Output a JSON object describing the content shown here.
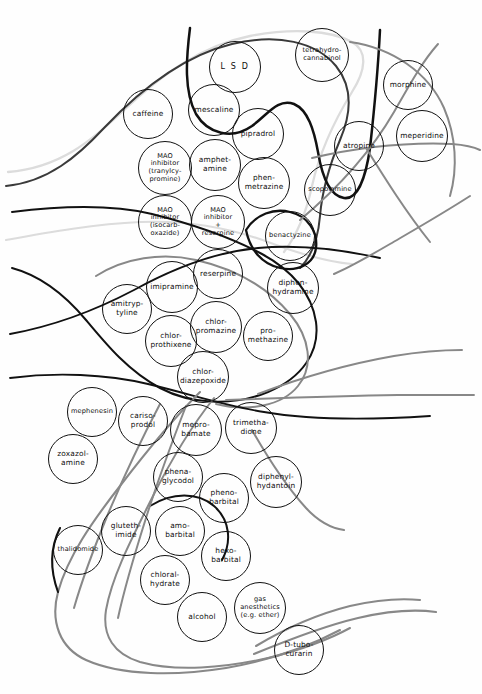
{
  "figure": {
    "caption_sliver": "",
    "canvas": {
      "width": 482,
      "height": 694
    },
    "background_color": "#fefefe"
  },
  "palette": {
    "circle_stroke": "#111111",
    "curve_black": "#111111",
    "curve_dark_gray": "#3a3a3a",
    "curve_mid_gray": "#888888",
    "curve_light_gray": "#dcdcdc",
    "label_text": "#0d0d0d"
  },
  "chart_data": {
    "type": "diagram",
    "subtype": "euler-venn-overlapping-sets",
    "node_shape": "circle",
    "node_count": 44,
    "nodes": [
      {
        "id": "lsd",
        "label": "L S D",
        "cx": 235,
        "cy": 67,
        "r": 26,
        "style": "spaced"
      },
      {
        "id": "thc",
        "label": "tetrahydro-\ncannabinol",
        "cx": 322,
        "cy": 55,
        "r": 27,
        "style": "tiny"
      },
      {
        "id": "morphine",
        "label": "morphine",
        "cx": 408,
        "cy": 85,
        "r": 25,
        "style": ""
      },
      {
        "id": "caffeine",
        "label": "caffeine",
        "cx": 148,
        "cy": 114,
        "r": 25,
        "style": ""
      },
      {
        "id": "mescaline",
        "label": "mescaline",
        "cx": 214,
        "cy": 110,
        "r": 26,
        "style": ""
      },
      {
        "id": "pipradrol",
        "label": "pipradrol",
        "cx": 258,
        "cy": 134,
        "r": 26,
        "style": ""
      },
      {
        "id": "meperidine",
        "label": "meperidine",
        "cx": 422,
        "cy": 136,
        "r": 26,
        "style": ""
      },
      {
        "id": "atropine",
        "label": "atropine",
        "cx": 359,
        "cy": 146,
        "r": 25,
        "style": ""
      },
      {
        "id": "mao_tranyl",
        "label": "MAO\ninhibitor\n(tranylcy-\npromine)",
        "cx": 165,
        "cy": 168,
        "r": 27,
        "style": "tiny"
      },
      {
        "id": "amphetamine",
        "label": "amphet-\namine",
        "cx": 215,
        "cy": 165,
        "r": 26,
        "style": ""
      },
      {
        "id": "phenmetrazine",
        "label": "phen-\nmetrazine",
        "cx": 264,
        "cy": 183,
        "r": 26,
        "style": ""
      },
      {
        "id": "scopolamine",
        "label": "scopolamine",
        "cx": 330,
        "cy": 190,
        "r": 26,
        "style": "tiny"
      },
      {
        "id": "mao_isocarb",
        "label": "MAO\ninhibitor\n(isocarb-\noxazide)",
        "cx": 165,
        "cy": 222,
        "r": 27,
        "style": "tiny"
      },
      {
        "id": "mao_reserpine",
        "label": "MAO\ninhibitor\n+\nreserpine",
        "cx": 218,
        "cy": 222,
        "r": 27,
        "style": "tiny"
      },
      {
        "id": "benactyzine",
        "label": "benactyzine",
        "cx": 290,
        "cy": 236,
        "r": 25,
        "style": "tiny"
      },
      {
        "id": "reserpine",
        "label": "reserpine",
        "cx": 218,
        "cy": 274,
        "r": 25,
        "style": ""
      },
      {
        "id": "diphenhydramine",
        "label": "diphen-\nhydramine",
        "cx": 293,
        "cy": 288,
        "r": 26,
        "style": ""
      },
      {
        "id": "imipramine",
        "label": "imipramine",
        "cx": 172,
        "cy": 287,
        "r": 26,
        "style": ""
      },
      {
        "id": "amitryptyline",
        "label": "amitryp-\ntyline",
        "cx": 127,
        "cy": 309,
        "r": 25,
        "style": ""
      },
      {
        "id": "chlorpromazine",
        "label": "chlor-\npromazine",
        "cx": 216,
        "cy": 327,
        "r": 26,
        "style": ""
      },
      {
        "id": "promethazine",
        "label": "pro-\nmethazine",
        "cx": 268,
        "cy": 336,
        "r": 25,
        "style": ""
      },
      {
        "id": "chlorprothixene",
        "label": "chlor-\nprothixene",
        "cx": 171,
        "cy": 341,
        "r": 26,
        "style": ""
      },
      {
        "id": "chlordiazepoxide",
        "label": "chlor-\ndiazepoxide",
        "cx": 203,
        "cy": 377,
        "r": 26,
        "style": ""
      },
      {
        "id": "mephenesin",
        "label": "mephenesin",
        "cx": 92,
        "cy": 412,
        "r": 25,
        "style": "tiny"
      },
      {
        "id": "carisoprodol",
        "label": "cariso-\nprodol",
        "cx": 143,
        "cy": 421,
        "r": 25,
        "style": ""
      },
      {
        "id": "meprobamate",
        "label": "mepro-\nbamate",
        "cx": 196,
        "cy": 430,
        "r": 26,
        "style": ""
      },
      {
        "id": "trimethadione",
        "label": "trimetha-\ndione",
        "cx": 251,
        "cy": 428,
        "r": 26,
        "style": ""
      },
      {
        "id": "zoxazolamine",
        "label": "zoxazol-\namine",
        "cx": 73,
        "cy": 459,
        "r": 25,
        "style": ""
      },
      {
        "id": "phenaglycodol",
        "label": "phena-\nglycodol",
        "cx": 178,
        "cy": 477,
        "r": 25,
        "style": ""
      },
      {
        "id": "phenobarbital",
        "label": "pheno-\nbarbital",
        "cx": 224,
        "cy": 498,
        "r": 25,
        "style": ""
      },
      {
        "id": "diphenylhydantoin",
        "label": "diphenyl-\nhydantoin",
        "cx": 276,
        "cy": 482,
        "r": 26,
        "style": ""
      },
      {
        "id": "glutethimide",
        "label": "gluteth-\nimide",
        "cx": 126,
        "cy": 531,
        "r": 25,
        "style": ""
      },
      {
        "id": "amobarbital",
        "label": "amo-\nbarbital",
        "cx": 180,
        "cy": 531,
        "r": 25,
        "style": ""
      },
      {
        "id": "hexobarbital",
        "label": "hexo-\nbarbital",
        "cx": 226,
        "cy": 556,
        "r": 25,
        "style": ""
      },
      {
        "id": "thalidomide",
        "label": "thalidomide",
        "cx": 78,
        "cy": 550,
        "r": 25,
        "style": "tiny"
      },
      {
        "id": "chloralhydrate",
        "label": "chloral-\nhydrate",
        "cx": 165,
        "cy": 580,
        "r": 25,
        "style": ""
      },
      {
        "id": "alcohol",
        "label": "alcohol",
        "cx": 202,
        "cy": 617,
        "r": 25,
        "style": ""
      },
      {
        "id": "gas_anesthetics",
        "label": "gas\nanesthetics\n(e.g. ether)",
        "cx": 260,
        "cy": 608,
        "r": 26,
        "style": "tiny"
      },
      {
        "id": "d_tubocurarin",
        "label": "D-tubo-\ncurarin",
        "cx": 299,
        "cy": 650,
        "r": 25,
        "style": ""
      }
    ],
    "boundary_curves": [
      {
        "id": "stimulant-hallucinogen-envelope",
        "color": "#3a3a3a",
        "width": 2.0
      },
      {
        "id": "hallucinogen-inner-loop",
        "color": "#111111",
        "width": 2.4
      },
      {
        "id": "anticholinergic-loop",
        "color": "#111111",
        "width": 2.4
      },
      {
        "id": "antidepressant-antipsychotic-envelope",
        "color": "#111111",
        "width": 2.0
      },
      {
        "id": "sedative-hypnotic-envelope",
        "color": "#888888",
        "width": 2.0
      },
      {
        "id": "light-outer-envelope",
        "color": "#dcdcdc",
        "width": 2.2
      },
      {
        "id": "narcotic-analgesic-sweep",
        "color": "#888888",
        "width": 2.0
      },
      {
        "id": "muscle-relaxant-sweep",
        "color": "#888888",
        "width": 2.0
      }
    ]
  }
}
